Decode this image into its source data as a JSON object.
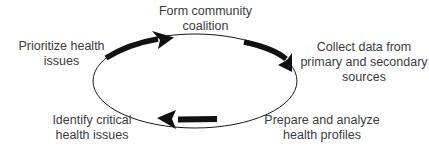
{
  "diagram": {
    "type": "cycle",
    "direction": "clockwise",
    "colors": {
      "stroke": "#1a1a1a",
      "text": "#3c3c3c",
      "background": "#ffffff"
    },
    "steps": [
      {
        "id": "form",
        "lines": [
          "Form community",
          "coalition"
        ]
      },
      {
        "id": "collect",
        "lines": [
          "Collect data from",
          "primary and secondary",
          "sources"
        ]
      },
      {
        "id": "prepare",
        "lines": [
          "Prepare and analyze",
          "health profiles"
        ]
      },
      {
        "id": "identify",
        "lines": [
          "Identify critical",
          "health issues"
        ]
      },
      {
        "id": "prioritize",
        "lines": [
          "Prioritize health",
          "issues"
        ]
      }
    ]
  }
}
